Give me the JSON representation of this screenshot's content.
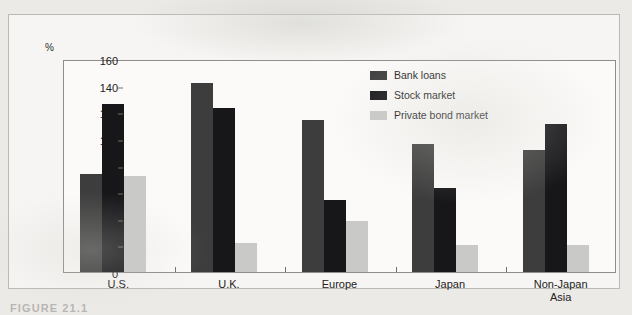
{
  "figure": {
    "y_unit_label": "%",
    "caption": "FIGURE 21.1"
  },
  "legend": {
    "position": "inside-top-right",
    "items": [
      {
        "label": "Bank loans",
        "color": "#3d3d3d",
        "key": "bank_loans"
      },
      {
        "label": "Stock market",
        "color": "#17171a",
        "key": "stock_market"
      },
      {
        "label": "Private bond market",
        "color": "#c9c9c8",
        "key": "private_bond_market"
      }
    ]
  },
  "chart_data": {
    "type": "bar",
    "title": "",
    "subtitle": "",
    "xlabel": "",
    "ylabel": "%",
    "ylim": [
      0,
      160
    ],
    "yticks": [
      0,
      20,
      40,
      60,
      80,
      100,
      120,
      140,
      160
    ],
    "grid": false,
    "legend_position": "inside-top-right",
    "categories": [
      "U.S.",
      "U.K.",
      "Europe",
      "Japan",
      "Non-Japan\nAsia"
    ],
    "series": [
      {
        "name": "Bank loans",
        "color": "#3d3d3d",
        "values": [
          74,
          142,
          114,
          96,
          92
        ]
      },
      {
        "name": "Stock market",
        "color": "#17171a",
        "values": [
          126,
          123,
          54,
          63,
          111
        ]
      },
      {
        "name": "Private bond market",
        "color": "#c9c9c8",
        "values": [
          72,
          22,
          38,
          20,
          20
        ]
      }
    ],
    "annotations": []
  }
}
